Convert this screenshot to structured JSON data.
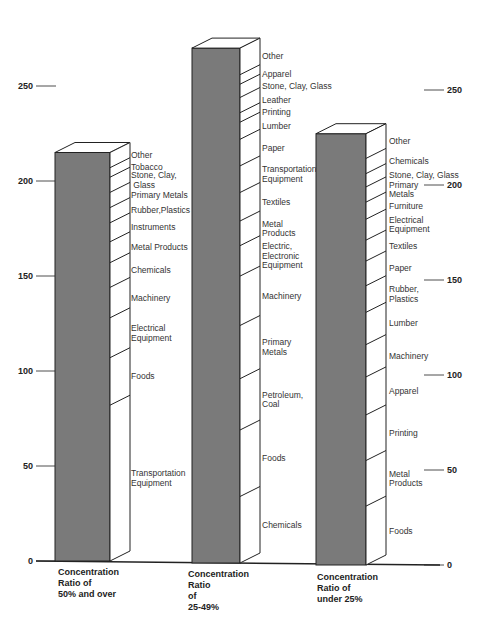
{
  "chart_data": {
    "type": "bar",
    "subtype": "stacked-3d-column",
    "title": "",
    "xlabel": "",
    "ylabel": "",
    "ylim": [
      0,
      275
    ],
    "yticks": [
      0,
      50,
      100,
      150,
      200,
      250
    ],
    "grid": false,
    "legend": "inline labels beside each column",
    "categories": [
      "Concentration Ratio of 50% and over",
      "Concentration Ratio of 25-49%",
      "Concentration Ratio of under 25%"
    ],
    "category_labels": [
      [
        "Concentration",
        "Ratio of",
        "50% and over"
      ],
      [
        "Concentration",
        "Ratio",
        "of",
        "25-49%"
      ],
      [
        "Concentration",
        "Ratio of",
        "under 25%"
      ]
    ],
    "totals": [
      215,
      271,
      227
    ],
    "series": [
      {
        "name": "Concentration Ratio of 50% and over",
        "segments": [
          {
            "label": "Transportation Equipment",
            "lines": [
              "Transportation",
              "Equipment"
            ],
            "value": 82
          },
          {
            "label": "Foods",
            "lines": [
              "Foods"
            ],
            "value": 25
          },
          {
            "label": "Electrical Equipment",
            "lines": [
              "Electrical",
              "Equipment"
            ],
            "value": 21
          },
          {
            "label": "Machinery",
            "lines": [
              "Machinery"
            ],
            "value": 16
          },
          {
            "label": "Chemicals",
            "lines": [
              "Chemicals"
            ],
            "value": 13
          },
          {
            "label": "Metal Products",
            "lines": [
              "Metal Products"
            ],
            "value": 11
          },
          {
            "label": "Instruments",
            "lines": [
              "Instruments"
            ],
            "value": 10
          },
          {
            "label": "Rubber, Plastics",
            "lines": [
              "Rubber,Plastics"
            ],
            "value": 8
          },
          {
            "label": "Primary Metals",
            "lines": [
              "Primary Metals"
            ],
            "value": 8
          },
          {
            "label": "Stone, Clay, Glass",
            "lines": [
              "Stone, Clay,",
              " Glass"
            ],
            "value": 8
          },
          {
            "label": "Tobacco",
            "lines": [
              "Tobacco"
            ],
            "value": 5
          },
          {
            "label": "Other",
            "lines": [
              "Other"
            ],
            "value": 8
          }
        ]
      },
      {
        "name": "Concentration Ratio of 25-49%",
        "segments": [
          {
            "label": "Chemicals",
            "lines": [
              "Chemicals"
            ],
            "value": 35
          },
          {
            "label": "Foods",
            "lines": [
              "Foods"
            ],
            "value": 35
          },
          {
            "label": "Petroleum, Coal",
            "lines": [
              "Petroleum,",
              "Coal"
            ],
            "value": 27
          },
          {
            "label": "Primary Metals",
            "lines": [
              "Primary",
              "Metals"
            ],
            "value": 28
          },
          {
            "label": "Machinery",
            "lines": [
              "Machinery"
            ],
            "value": 26
          },
          {
            "label": "Electric, Electronic Equipment",
            "lines": [
              "Electric,",
              "Electronic",
              "Equipment"
            ],
            "value": 16
          },
          {
            "label": "Metal Products",
            "lines": [
              "Metal",
              "Products"
            ],
            "value": 13
          },
          {
            "label": "Textiles",
            "lines": [
              "Textiles"
            ],
            "value": 15
          },
          {
            "label": "Transportation Equipment",
            "lines": [
              "Transportation",
              "Equipment"
            ],
            "value": 14
          },
          {
            "label": "Paper",
            "lines": [
              "Paper"
            ],
            "value": 14
          },
          {
            "label": "Lumber",
            "lines": [
              "Lumber"
            ],
            "value": 9
          },
          {
            "label": "Printing",
            "lines": [
              "Printing"
            ],
            "value": 5
          },
          {
            "label": "Leather",
            "lines": [
              "Leather"
            ],
            "value": 8
          },
          {
            "label": "Stone, Clay, Glass",
            "lines": [
              "Stone, Clay, Glass"
            ],
            "value": 7
          },
          {
            "label": "Apparel",
            "lines": [
              "Apparel"
            ],
            "value": 5
          },
          {
            "label": "Other",
            "lines": [
              "Other"
            ],
            "value": 14
          }
        ]
      },
      {
        "name": "Concentration Ratio of under 25%",
        "segments": [
          {
            "label": "Foods",
            "lines": [
              "Foods"
            ],
            "value": 31
          },
          {
            "label": "Metal Products",
            "lines": [
              "Metal",
              "Products"
            ],
            "value": 24
          },
          {
            "label": "Printing",
            "lines": [
              "Printing"
            ],
            "value": 24
          },
          {
            "label": "Apparel",
            "lines": [
              "Apparel"
            ],
            "value": 20
          },
          {
            "label": "Machinery",
            "lines": [
              "Machinery"
            ],
            "value": 17
          },
          {
            "label": "Lumber",
            "lines": [
              "Lumber"
            ],
            "value": 17
          },
          {
            "label": "Rubber, Plastics",
            "lines": [
              "Rubber,",
              "Plastics"
            ],
            "value": 14
          },
          {
            "label": "Paper",
            "lines": [
              "Paper"
            ],
            "value": 13
          },
          {
            "label": "Textiles",
            "lines": [
              "Textiles"
            ],
            "value": 11
          },
          {
            "label": "Electrical Equipment",
            "lines": [
              "Electrical",
              "Equipment"
            ],
            "value": 11
          },
          {
            "label": "Furniture",
            "lines": [
              "Furniture"
            ],
            "value": 9
          },
          {
            "label": "Primary Metals",
            "lines": [
              "Primary",
              "Metals"
            ],
            "value": 8
          },
          {
            "label": "Stone, Clay, Glass",
            "lines": [
              "Stone, Clay, Glass"
            ],
            "value": 7
          },
          {
            "label": "Chemicals",
            "lines": [
              "Chemicals"
            ],
            "value": 8
          },
          {
            "label": "Other",
            "lines": [
              "Other"
            ],
            "value": 13
          }
        ]
      }
    ],
    "colors": {
      "bar_front": "#7a7a7a",
      "bar_side": "#ffffff",
      "outline": "#222222",
      "text": "#333333"
    }
  }
}
